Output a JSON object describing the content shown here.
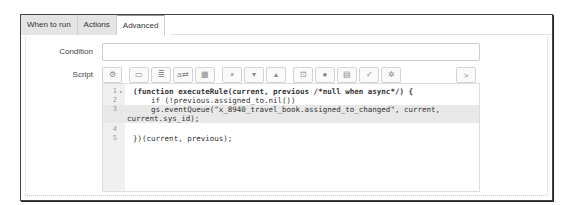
{
  "tabs": [
    {
      "label": "When to run",
      "active": false
    },
    {
      "label": "Actions",
      "active": false
    },
    {
      "label": "Advanced",
      "active": true
    }
  ],
  "fields": {
    "condition": {
      "label": "Condition",
      "value": ""
    },
    "script": {
      "label": "Script"
    }
  },
  "toolbar": {
    "buttons": [
      {
        "name": "script-debugger-icon",
        "glyph": "⚙"
      },
      {
        "name": "comment-icon",
        "glyph": "▭"
      },
      {
        "name": "format-code-icon",
        "glyph": "≣"
      },
      {
        "name": "replace-icon",
        "glyph": "a⇄"
      },
      {
        "name": "replace-all-icon",
        "glyph": "▦"
      },
      {
        "name": "search-icon",
        "glyph": "⌕"
      },
      {
        "name": "search-next-icon",
        "glyph": "▾"
      },
      {
        "name": "search-previous-icon",
        "glyph": "▴"
      },
      {
        "name": "fullscreen-icon",
        "glyph": "⊡"
      },
      {
        "name": "help-icon",
        "glyph": "●"
      },
      {
        "name": "save-icon",
        "glyph": "▤"
      },
      {
        "name": "syntax-check-icon",
        "glyph": "✓"
      },
      {
        "name": "settings-icon",
        "glyph": "✲"
      }
    ],
    "expand_glyph": ">"
  },
  "editor": {
    "lines": [
      {
        "n": "1",
        "fold": "▾",
        "text": "(function executeRule(current, previous /*null when async*/) {",
        "hl": false
      },
      {
        "n": "2",
        "fold": "",
        "text": "    if (!previous.assigned_to.nil())",
        "hl": false
      },
      {
        "n": "3",
        "fold": "",
        "text": "    gs.eventQueue(\"x_8940_travel_book.assigned_to_changed\", current,",
        "hl": true
      },
      {
        "n": "",
        "fold": "",
        "text": "current.sys_id);",
        "hl": true
      },
      {
        "n": "4",
        "fold": "",
        "text": "",
        "hl": false
      },
      {
        "n": "5",
        "fold": "",
        "text": "})(current, previous);",
        "hl": false
      }
    ]
  }
}
